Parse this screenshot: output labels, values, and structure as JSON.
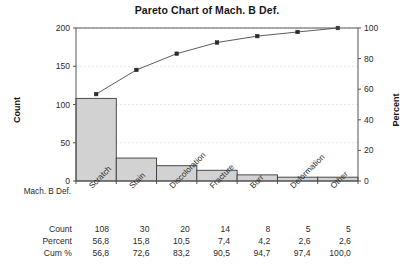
{
  "chart_data": {
    "type": "bar",
    "title": "Pareto Chart of Mach. B Def.",
    "xlabel": "Mach. B Def.",
    "ylabel": "Count",
    "y2label": "Percent",
    "categories": [
      "Scratch",
      "Stain",
      "Discoloration",
      "Fracture",
      "Burr",
      "Deformation",
      "Other"
    ],
    "values": [
      108,
      30,
      20,
      14,
      8,
      5,
      5
    ],
    "ylim": [
      0,
      200
    ],
    "yticks": [
      "0",
      "50",
      "100",
      "150",
      "200"
    ],
    "ytick_values": [
      0,
      50,
      100,
      150,
      200
    ],
    "y2lim": [
      0,
      100
    ],
    "y2ticks": [
      "0",
      "20",
      "40",
      "60",
      "80",
      "100"
    ],
    "y2tick_values": [
      0,
      20,
      40,
      60,
      80,
      100
    ],
    "grid": true,
    "legend": "none",
    "series": [
      {
        "name": "Count",
        "type": "bar",
        "values": [
          108,
          30,
          20,
          14,
          8,
          5,
          5
        ]
      },
      {
        "name": "Cum %",
        "type": "line",
        "values": [
          56.8,
          72.6,
          83.2,
          90.5,
          94.7,
          97.4,
          100.0
        ]
      }
    ],
    "table": {
      "rows": [
        {
          "label": "Count",
          "values": [
            "108",
            "30",
            "20",
            "14",
            "8",
            "5",
            "5"
          ]
        },
        {
          "label": "Percent",
          "values": [
            "56,8",
            "15,8",
            "10,5",
            "7,4",
            "4,2",
            "2,6",
            "2,6"
          ]
        },
        {
          "label": "Cum %",
          "values": [
            "56,8",
            "72,6",
            "83,2",
            "90,5",
            "94,7",
            "97,4",
            "100,0"
          ]
        }
      ]
    },
    "colors": {
      "bar_fill": "#d2d2d2",
      "bar_stroke": "#3a3a3a",
      "line": "#4a4a4a",
      "marker": "#2a2a2a",
      "grid": "#e2e2e2",
      "axis": "#555555",
      "background": "#ffffff"
    }
  }
}
